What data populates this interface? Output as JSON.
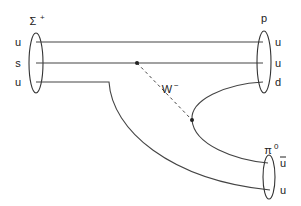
{
  "diagram": {
    "type": "feynman-diagram",
    "process": "Sigma+ -> p + pi0",
    "initial_particle": {
      "label": "Σ",
      "charge_superscript": "+",
      "quarks": [
        "u",
        "s",
        "u"
      ]
    },
    "final_particles": [
      {
        "label": "p",
        "charge_superscript": "",
        "quarks": [
          "u",
          "u",
          "d"
        ]
      },
      {
        "label": "π",
        "charge_superscript": "0",
        "quarks": [
          "u",
          "u"
        ],
        "antiquark_index": 0
      }
    ],
    "boson": {
      "label": "W",
      "charge_superscript": "−",
      "style": "dashed"
    }
  }
}
